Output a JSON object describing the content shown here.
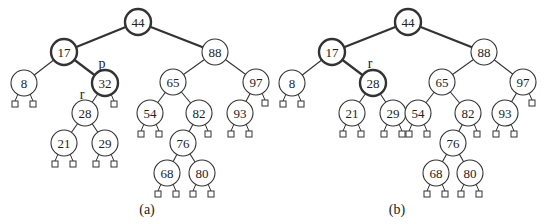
{
  "figure": {
    "node_radius": 13,
    "leaf_size": 6,
    "colors": {
      "stroke": "#333333",
      "text": "#222222",
      "fill": "#ffffff"
    }
  },
  "trees": [
    {
      "id": "a",
      "caption": "(a)",
      "caption_pos": [
        147,
        214
      ],
      "nodes": [
        {
          "key": "44",
          "x": 138,
          "y": 22,
          "bold": true
        },
        {
          "key": "17",
          "x": 64,
          "y": 52,
          "bold": true
        },
        {
          "key": "8",
          "x": 24,
          "y": 83
        },
        {
          "key": "32",
          "x": 105,
          "y": 83,
          "bold": true
        },
        {
          "key": "28",
          "x": 85,
          "y": 113
        },
        {
          "key": "21",
          "x": 64,
          "y": 143
        },
        {
          "key": "29",
          "x": 105,
          "y": 143
        },
        {
          "key": "88",
          "x": 215,
          "y": 52
        },
        {
          "key": "65",
          "x": 173,
          "y": 82
        },
        {
          "key": "97",
          "x": 256,
          "y": 82
        },
        {
          "key": "54",
          "x": 150,
          "y": 113
        },
        {
          "key": "82",
          "x": 199,
          "y": 113
        },
        {
          "key": "93",
          "x": 240,
          "y": 113
        },
        {
          "key": "76",
          "x": 183,
          "y": 143
        },
        {
          "key": "68",
          "x": 167,
          "y": 173
        },
        {
          "key": "80",
          "x": 202,
          "y": 173
        }
      ],
      "edges": [
        {
          "from": "44",
          "to": "17",
          "bold": true
        },
        {
          "from": "44",
          "to": "88",
          "bold": true
        },
        {
          "from": "17",
          "to": "8"
        },
        {
          "from": "17",
          "to": "32",
          "bold": true
        },
        {
          "from": "32",
          "to": "28"
        },
        {
          "from": "28",
          "to": "21"
        },
        {
          "from": "28",
          "to": "29"
        },
        {
          "from": "88",
          "to": "65"
        },
        {
          "from": "88",
          "to": "97"
        },
        {
          "from": "65",
          "to": "54"
        },
        {
          "from": "65",
          "to": "82"
        },
        {
          "from": "82",
          "to": "76"
        },
        {
          "from": "76",
          "to": "68"
        },
        {
          "from": "76",
          "to": "80"
        },
        {
          "from": "97",
          "to": "93"
        }
      ],
      "leaves": [
        {
          "parent": "8",
          "side": "L"
        },
        {
          "parent": "8",
          "side": "R"
        },
        {
          "parent": "32",
          "side": "R"
        },
        {
          "parent": "21",
          "side": "L"
        },
        {
          "parent": "21",
          "side": "R"
        },
        {
          "parent": "29",
          "side": "L"
        },
        {
          "parent": "29",
          "side": "R"
        },
        {
          "parent": "54",
          "side": "L"
        },
        {
          "parent": "54",
          "side": "R"
        },
        {
          "parent": "82",
          "side": "R"
        },
        {
          "parent": "68",
          "side": "L"
        },
        {
          "parent": "68",
          "side": "R"
        },
        {
          "parent": "80",
          "side": "L"
        },
        {
          "parent": "80",
          "side": "R"
        },
        {
          "parent": "93",
          "side": "L"
        },
        {
          "parent": "93",
          "side": "R"
        },
        {
          "parent": "97",
          "side": "R"
        }
      ],
      "labels": [
        {
          "text": "p",
          "x": 102,
          "y": 68
        },
        {
          "text": "r",
          "x": 82,
          "y": 99
        }
      ]
    },
    {
      "id": "b",
      "caption": "(b)",
      "caption_pos": [
        397,
        214
      ],
      "nodes": [
        {
          "key": "44",
          "x": 408,
          "y": 22,
          "bold": true
        },
        {
          "key": "17",
          "x": 332,
          "y": 52,
          "bold": true
        },
        {
          "key": "8",
          "x": 292,
          "y": 83
        },
        {
          "key": "28",
          "x": 373,
          "y": 83,
          "bold": true
        },
        {
          "key": "21",
          "x": 352,
          "y": 113
        },
        {
          "key": "29",
          "x": 393,
          "y": 113
        },
        {
          "key": "88",
          "x": 484,
          "y": 52
        },
        {
          "key": "65",
          "x": 442,
          "y": 82
        },
        {
          "key": "97",
          "x": 523,
          "y": 82
        },
        {
          "key": "54",
          "x": 418,
          "y": 113
        },
        {
          "key": "82",
          "x": 468,
          "y": 113
        },
        {
          "key": "93",
          "x": 505,
          "y": 113
        },
        {
          "key": "76",
          "x": 453,
          "y": 143
        },
        {
          "key": "68",
          "x": 436,
          "y": 173
        },
        {
          "key": "80",
          "x": 470,
          "y": 173
        }
      ],
      "edges": [
        {
          "from": "44",
          "to": "17",
          "bold": true
        },
        {
          "from": "44",
          "to": "88",
          "bold": true
        },
        {
          "from": "17",
          "to": "8"
        },
        {
          "from": "17",
          "to": "28",
          "bold": true
        },
        {
          "from": "28",
          "to": "21"
        },
        {
          "from": "28",
          "to": "29"
        },
        {
          "from": "88",
          "to": "65"
        },
        {
          "from": "88",
          "to": "97"
        },
        {
          "from": "65",
          "to": "54"
        },
        {
          "from": "65",
          "to": "82"
        },
        {
          "from": "82",
          "to": "76"
        },
        {
          "from": "76",
          "to": "68"
        },
        {
          "from": "76",
          "to": "80"
        },
        {
          "from": "97",
          "to": "93"
        }
      ],
      "leaves": [
        {
          "parent": "8",
          "side": "L"
        },
        {
          "parent": "8",
          "side": "R"
        },
        {
          "parent": "21",
          "side": "L"
        },
        {
          "parent": "21",
          "side": "R"
        },
        {
          "parent": "29",
          "side": "L"
        },
        {
          "parent": "29",
          "side": "R"
        },
        {
          "parent": "54",
          "side": "L"
        },
        {
          "parent": "54",
          "side": "R"
        },
        {
          "parent": "82",
          "side": "R"
        },
        {
          "parent": "68",
          "side": "L"
        },
        {
          "parent": "68",
          "side": "R"
        },
        {
          "parent": "80",
          "side": "L"
        },
        {
          "parent": "80",
          "side": "R"
        },
        {
          "parent": "93",
          "side": "L"
        },
        {
          "parent": "93",
          "side": "R"
        },
        {
          "parent": "97",
          "side": "R"
        }
      ],
      "labels": [
        {
          "text": "r",
          "x": 370,
          "y": 68
        }
      ]
    }
  ]
}
